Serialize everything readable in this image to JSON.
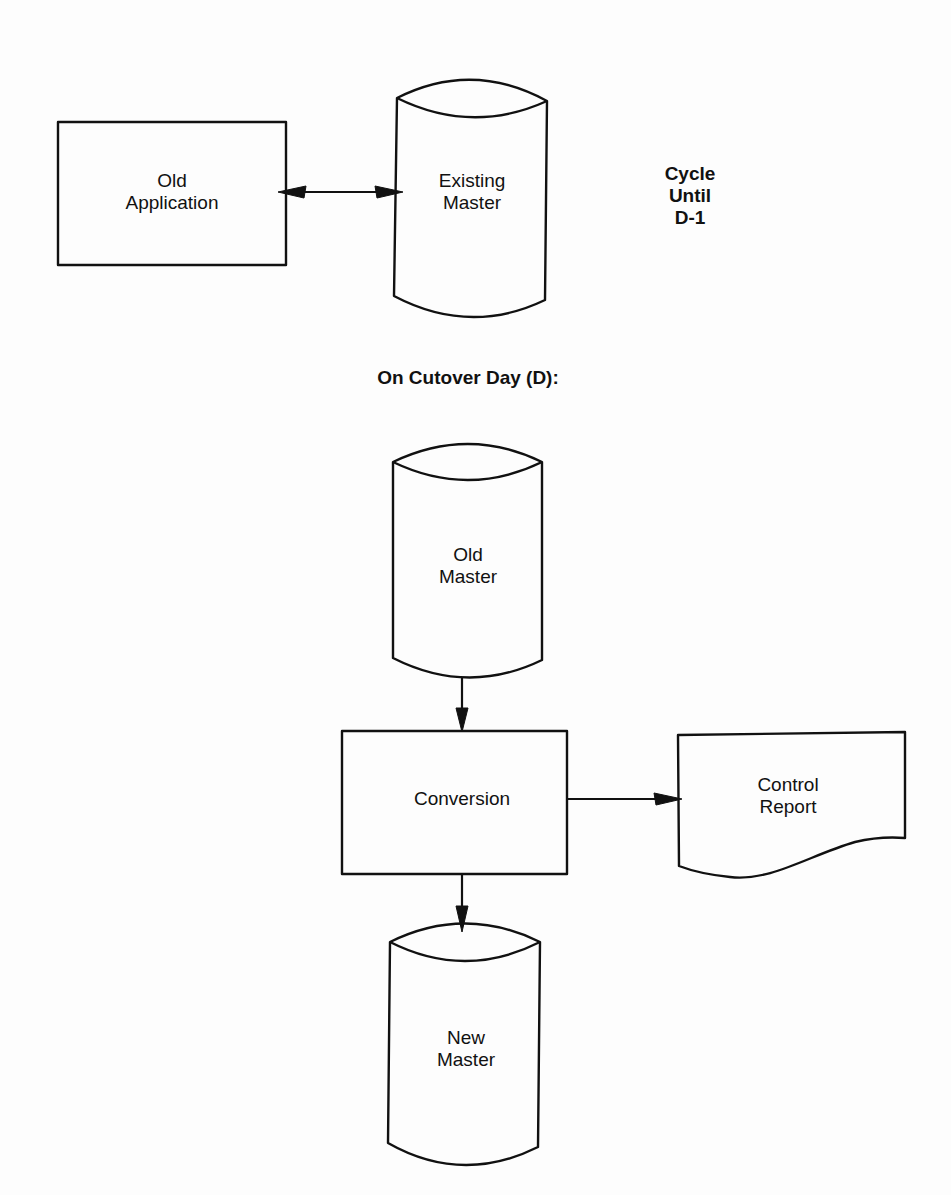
{
  "diagram": {
    "pre_cutover": {
      "old_application": {
        "label": "Old\nApplication",
        "shape": "process-rectangle"
      },
      "existing_master": {
        "label": "Existing\nMaster",
        "shape": "cylinder-datastore"
      },
      "cycle_note": "Cycle\nUntil\nD-1",
      "connection": {
        "from": "old_application",
        "to": "existing_master",
        "type": "bidirectional-arrow"
      }
    },
    "section_heading": "On Cutover Day (D):",
    "cutover": {
      "old_master": {
        "label": "Old\nMaster",
        "shape": "cylinder-datastore"
      },
      "conversion": {
        "label": "Conversion",
        "shape": "process-rectangle"
      },
      "control_report": {
        "label": "Control\nReport",
        "shape": "document"
      },
      "new_master": {
        "label": "New\nMaster",
        "shape": "cylinder-datastore"
      },
      "connections": [
        {
          "from": "old_master",
          "to": "conversion",
          "type": "arrow"
        },
        {
          "from": "conversion",
          "to": "control_report",
          "type": "arrow"
        },
        {
          "from": "conversion",
          "to": "new_master",
          "type": "arrow"
        }
      ]
    },
    "colors": {
      "stroke": "#111111",
      "background": "#fdfdfd"
    }
  }
}
